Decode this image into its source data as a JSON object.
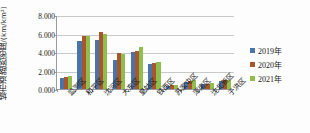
{
  "chart_data": {
    "type": "bar",
    "title": "",
    "ylabel": "城市道路网密度/(km/km²)",
    "ylabel_main": "城市道路网密度",
    "ylabel_unit": "/(km/km²)",
    "xlabel": "",
    "ylim": [
      0,
      8
    ],
    "yticks": [
      0,
      2,
      4,
      6,
      8
    ],
    "ytick_labels": [
      "0.000",
      "2.000",
      "4.000",
      "6.000",
      "8.000"
    ],
    "grid": true,
    "legend_position": "right",
    "categories": [
      "监测区",
      "和平区",
      "沈河区",
      "大东区",
      "皇姑区",
      "铁西区",
      "苏家屯区",
      "浑南区",
      "沈北新区",
      "于洪区"
    ],
    "series": [
      {
        "name": "2019年",
        "color": "#4A74A8",
        "values": [
          1.2,
          5.2,
          5.3,
          3.1,
          4.0,
          2.7,
          0.35,
          0.8,
          0.5,
          0.85
        ]
      },
      {
        "name": "2020年",
        "color": "#A8562B",
        "values": [
          1.3,
          5.7,
          6.2,
          3.9,
          4.1,
          2.8,
          0.4,
          0.9,
          0.55,
          0.95
        ]
      },
      {
        "name": "2021年",
        "color": "#90BE4E",
        "values": [
          1.4,
          5.7,
          6.0,
          3.8,
          4.5,
          2.9,
          0.45,
          0.95,
          0.6,
          1.0
        ]
      }
    ]
  },
  "legend": {
    "items": [
      {
        "label": "2019年",
        "color": "#4A74A8"
      },
      {
        "label": "2020年",
        "color": "#A8562B"
      },
      {
        "label": "2021年",
        "color": "#90BE4E"
      }
    ]
  }
}
